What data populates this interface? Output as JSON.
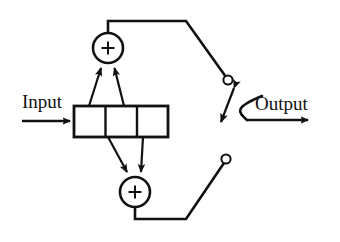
{
  "diagram": {
    "labels": {
      "input": "Input",
      "output": "Output",
      "upper_adder_symbol": "+",
      "lower_adder_symbol": "+"
    },
    "colors": {
      "background": "#ffffff",
      "stroke": "#111111",
      "node_fill": "#ffffff"
    },
    "blocks": [
      {
        "name": "delay-line",
        "type": "tapped-delay-line",
        "cells": 3,
        "x": 74,
        "y": 106,
        "width": 94,
        "height": 31
      },
      {
        "name": "upper-adder",
        "type": "summing-junction",
        "symbol": "+",
        "cx": 108,
        "cy": 48,
        "r": 15,
        "inputs": 2
      },
      {
        "name": "lower-adder",
        "type": "summing-junction",
        "symbol": "+",
        "cx": 135,
        "cy": 192,
        "r": 15,
        "inputs": 2
      },
      {
        "name": "upper-contact",
        "type": "switch-contact",
        "cx": 228,
        "cy": 80,
        "r": 4.5
      },
      {
        "name": "lower-contact",
        "type": "switch-contact",
        "cx": 226,
        "cy": 159,
        "r": 4.5
      },
      {
        "name": "selector-switch",
        "type": "two-position-switch",
        "throw_from": [
          236,
          86
        ],
        "throw_to": [
          220,
          124
        ]
      }
    ],
    "signals": [
      {
        "name": "input-arrow",
        "from": [
          22,
          121
        ],
        "to": [
          74,
          121
        ],
        "arrow": true
      },
      {
        "name": "output-arrow",
        "from": [
          247,
          120
        ],
        "to": [
          312,
          120
        ],
        "arrow": true
      },
      {
        "name": "upper-feedback",
        "path": "circle-top to contact",
        "arrow": false
      },
      {
        "name": "lower-feedback",
        "path": "circle-bottom to contact",
        "arrow": false
      },
      {
        "name": "tap-up-1",
        "from": [
          90,
          106
        ],
        "to": [
          101,
          63
        ],
        "arrow": true
      },
      {
        "name": "tap-up-2",
        "from": [
          122,
          106
        ],
        "to": [
          113,
          63
        ],
        "arrow": true
      },
      {
        "name": "tap-down-1",
        "from": [
          108,
          137
        ],
        "to": [
          128,
          177
        ],
        "arrow": true
      },
      {
        "name": "tap-down-2",
        "from": [
          140,
          137
        ],
        "to": [
          142,
          177
        ],
        "arrow": true
      }
    ]
  }
}
